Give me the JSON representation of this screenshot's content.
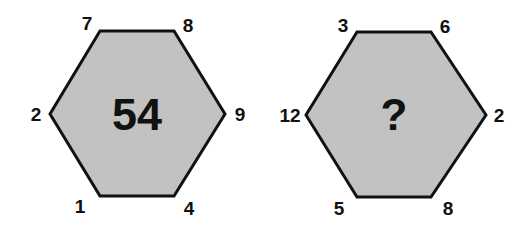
{
  "colors": {
    "fill": "#c2c2c2",
    "stroke": "#111111",
    "text": "#111111"
  },
  "hexagons": [
    {
      "center": "54",
      "top_left": "7",
      "top_right": "8",
      "right": "9",
      "bottom_right": "4",
      "bottom_left": "1",
      "left": "2"
    },
    {
      "center": "?",
      "top_left": "3",
      "top_right": "6",
      "right": "2",
      "bottom_right": "8",
      "bottom_left": "5",
      "left": "12"
    }
  ]
}
